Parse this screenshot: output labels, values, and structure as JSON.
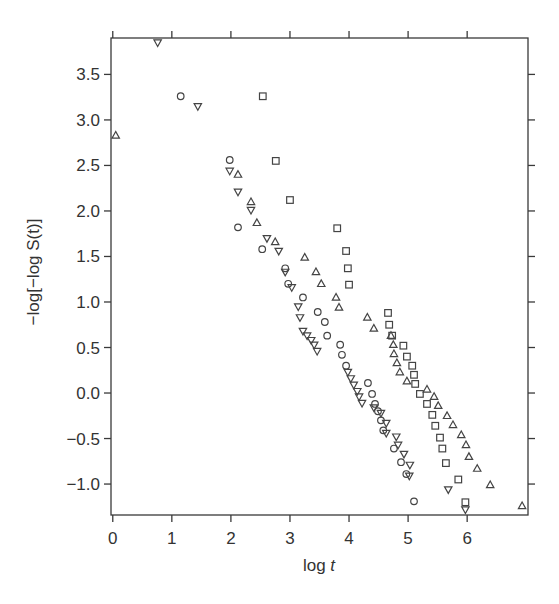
{
  "chart_data": {
    "type": "scatter",
    "title": "",
    "xlabel": "log t",
    "ylabel": "−log[−log S(t)]",
    "xlim": [
      -0.03,
      7.03
    ],
    "ylim": [
      -1.34,
      3.9
    ],
    "xticks": [
      0,
      1,
      2,
      3,
      4,
      5,
      6
    ],
    "xtick_labels": [
      "0",
      "1",
      "2",
      "3",
      "4",
      "5",
      "6"
    ],
    "yticks": [
      -1.0,
      -0.5,
      0.0,
      0.5,
      1.0,
      1.5,
      2.0,
      2.5,
      3.0,
      3.5
    ],
    "ytick_labels": [
      "−1.0",
      "−0.5",
      "0.0",
      "0.5",
      "1.0",
      "1.5",
      "2.0",
      "2.5",
      "3.0",
      "3.5"
    ],
    "grid": false,
    "legend": null,
    "series": [
      {
        "name": "circle",
        "marker": "circle",
        "x": [
          1.15,
          1.98,
          2.12,
          2.53,
          2.92,
          2.97,
          3.22,
          3.47,
          3.59,
          3.63,
          3.85,
          3.88,
          3.95,
          4.32,
          4.39,
          4.44,
          4.49,
          4.54,
          4.58,
          4.76,
          4.88,
          4.97,
          5.1
        ],
        "y": [
          3.26,
          2.56,
          1.82,
          1.58,
          1.37,
          1.2,
          1.05,
          0.89,
          0.78,
          0.63,
          0.53,
          0.42,
          0.3,
          0.11,
          -0.01,
          -0.12,
          -0.2,
          -0.3,
          -0.41,
          -0.61,
          -0.76,
          -0.89,
          -1.19
        ]
      },
      {
        "name": "down-triangle",
        "marker": "triangle-down",
        "x": [
          0.76,
          1.44,
          1.98,
          2.12,
          2.34,
          2.61,
          2.81,
          2.92,
          3.03,
          3.14,
          3.17,
          3.22,
          3.29,
          3.36,
          3.41,
          3.46,
          3.98,
          4.03,
          4.08,
          4.14,
          4.17,
          4.22,
          4.42,
          4.54,
          4.63,
          4.63,
          4.8,
          4.83,
          4.93,
          5.03,
          5.02,
          5.68,
          5.97
        ],
        "y": [
          3.85,
          3.15,
          2.44,
          2.21,
          2.01,
          1.7,
          1.56,
          1.33,
          1.16,
          0.95,
          0.83,
          0.68,
          0.63,
          0.58,
          0.53,
          0.46,
          0.23,
          0.16,
          0.09,
          0.02,
          -0.04,
          -0.11,
          -0.16,
          -0.22,
          -0.33,
          -0.44,
          -0.48,
          -0.57,
          -0.67,
          -0.79,
          -0.91,
          -1.06,
          -1.28
        ]
      },
      {
        "name": "up-triangle",
        "marker": "triangle-up",
        "x": [
          0.05,
          2.12,
          2.34,
          2.44,
          2.75,
          3.25,
          3.44,
          3.53,
          3.78,
          3.83,
          4.31,
          4.42,
          4.71,
          4.75,
          4.76,
          4.81,
          4.86,
          4.98,
          5.32,
          5.44,
          5.51,
          5.66,
          5.76,
          5.9,
          5.98,
          6.03,
          6.17,
          6.39,
          6.93
        ],
        "y": [
          2.83,
          2.4,
          2.1,
          1.87,
          1.66,
          1.49,
          1.33,
          1.2,
          1.05,
          0.94,
          0.83,
          0.71,
          0.63,
          0.53,
          0.43,
          0.33,
          0.23,
          0.13,
          0.04,
          -0.04,
          -0.14,
          -0.25,
          -0.35,
          -0.46,
          -0.57,
          -0.7,
          -0.83,
          -1.01,
          -1.24
        ]
      },
      {
        "name": "square",
        "marker": "square",
        "x": [
          2.54,
          2.76,
          3.0,
          3.8,
          3.95,
          3.98,
          4.0,
          4.66,
          4.68,
          4.73,
          4.92,
          4.98,
          5.07,
          5.1,
          5.12,
          5.2,
          5.32,
          5.41,
          5.46,
          5.54,
          5.58,
          5.64,
          5.85,
          5.97
        ],
        "y": [
          3.26,
          2.55,
          2.12,
          1.81,
          1.56,
          1.37,
          1.19,
          0.88,
          0.75,
          0.63,
          0.52,
          0.4,
          0.3,
          0.2,
          0.1,
          -0.01,
          -0.12,
          -0.24,
          -0.36,
          -0.49,
          -0.61,
          -0.77,
          -0.95,
          -1.2
        ]
      }
    ]
  },
  "layout": {
    "plot_left": 111,
    "plot_right": 528,
    "plot_top": 38,
    "plot_bottom": 515
  }
}
